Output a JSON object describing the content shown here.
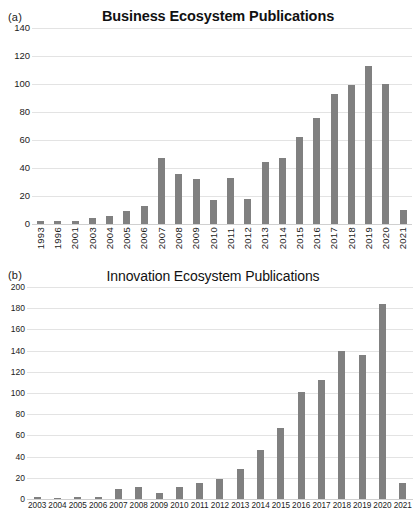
{
  "figure": {
    "panels": [
      {
        "label": "(a)",
        "title": "Business Ecosystem Publications"
      },
      {
        "label": "(b)",
        "title": "Innovation Ecosystem Publications"
      }
    ],
    "bar_color": "#808080",
    "gridline_color": "#e3e3e3"
  },
  "chart_data": [
    {
      "type": "bar",
      "panel": "(a)",
      "title": "Business Ecosystem Publications",
      "xlabel": "",
      "ylabel": "",
      "ylim": [
        0,
        140
      ],
      "yticks": [
        0,
        20,
        40,
        60,
        80,
        100,
        120,
        140
      ],
      "grid": true,
      "legend": "none",
      "orientation": "vertical",
      "categories": [
        "1993",
        "1996",
        "2001",
        "2003",
        "2004",
        "2005",
        "2006",
        "2007",
        "2008",
        "2009",
        "2010",
        "2011",
        "2012",
        "2013",
        "2014",
        "2015",
        "2016",
        "2017",
        "2018",
        "2019",
        "2020",
        "2021"
      ],
      "values": [
        2,
        2,
        2,
        4,
        6,
        9,
        13,
        47,
        36,
        32,
        17,
        33,
        18,
        44,
        47,
        62,
        76,
        93,
        99,
        113,
        100,
        10
      ]
    },
    {
      "type": "bar",
      "panel": "(b)",
      "title": "Innovation Ecosystem Publications",
      "xlabel": "",
      "ylabel": "",
      "ylim": [
        0,
        200
      ],
      "yticks": [
        0,
        20,
        40,
        60,
        80,
        100,
        120,
        140,
        160,
        180,
        200
      ],
      "grid": true,
      "legend": "none",
      "orientation": "vertical",
      "categories": [
        "2003",
        "2004",
        "2005",
        "2006",
        "2007",
        "2008",
        "2009",
        "2010",
        "2011",
        "2012",
        "2013",
        "2014",
        "2015",
        "2016",
        "2017",
        "2018",
        "2019",
        "2020",
        "2021"
      ],
      "values": [
        2,
        1,
        2,
        2,
        9,
        11,
        6,
        11,
        15,
        19,
        28,
        46,
        67,
        101,
        112,
        140,
        136,
        184,
        15
      ]
    }
  ]
}
